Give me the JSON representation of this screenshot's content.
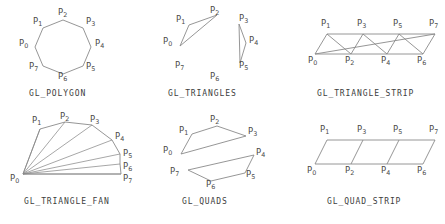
{
  "figure": {
    "background_color": "#ffffff",
    "line_color": "#8a8a8a",
    "label_color": "#4a4a4a",
    "caption_color": "#3d3d3d",
    "width": 445,
    "height": 224
  },
  "panels": [
    {
      "id": "gl-polygon",
      "caption": "GL_POLYGON",
      "vertex_count": 8,
      "vertices": [
        {
          "name": "P",
          "index": "0",
          "label_x": 9,
          "label_y": 39
        },
        {
          "name": "P",
          "index": "1",
          "label_x": 22,
          "label_y": 17
        },
        {
          "name": "P",
          "index": "2",
          "label_x": 48,
          "label_y": 8
        },
        {
          "name": "P",
          "index": "3",
          "label_x": 75,
          "label_y": 17
        },
        {
          "name": "P",
          "index": "4",
          "label_x": 86,
          "label_y": 39
        },
        {
          "name": "P",
          "index": "5",
          "label_x": 75,
          "label_y": 62
        },
        {
          "name": "P",
          "index": "6",
          "label_x": 48,
          "label_y": 72
        },
        {
          "name": "P",
          "index": "7",
          "label_x": 20,
          "label_y": 62
        }
      ],
      "caption_x": 22,
      "caption_y": 86
    },
    {
      "id": "gl-triangles",
      "caption": "GL_TRIANGLES",
      "vertex_count": 8,
      "vertices": [
        {
          "name": "P",
          "index": "0",
          "label_x": 2,
          "label_y": 36
        },
        {
          "name": "P",
          "index": "1",
          "label_x": 14,
          "label_y": 15
        },
        {
          "name": "P",
          "index": "2",
          "label_x": 45,
          "label_y": 5
        },
        {
          "name": "P",
          "index": "3",
          "label_x": 78,
          "label_y": 14
        },
        {
          "name": "P",
          "index": "4",
          "label_x": 88,
          "label_y": 35
        },
        {
          "name": "P",
          "index": "5",
          "label_x": 78,
          "label_y": 59
        },
        {
          "name": "P",
          "index": "6",
          "label_x": 48,
          "label_y": 72
        },
        {
          "name": "P",
          "index": "7",
          "label_x": 14,
          "label_y": 59
        }
      ],
      "caption_x": 10,
      "caption_y": 86
    },
    {
      "id": "gl-triangle-strip",
      "caption": "GL_TRIANGLE_STRIP",
      "vertex_count": 8,
      "vertices": [
        {
          "name": "P",
          "index": "0",
          "label_x": 2,
          "label_y": 56
        },
        {
          "name": "P",
          "index": "1",
          "label_x": 15,
          "label_y": 8
        },
        {
          "name": "P",
          "index": "2",
          "label_x": 42,
          "label_y": 56
        },
        {
          "name": "P",
          "index": "3",
          "label_x": 54,
          "label_y": 8
        },
        {
          "name": "P",
          "index": "4",
          "label_x": 80,
          "label_y": 56
        },
        {
          "name": "P",
          "index": "5",
          "label_x": 92,
          "label_y": 8
        },
        {
          "name": "P",
          "index": "6",
          "label_x": 116,
          "label_y": 56
        },
        {
          "name": "P",
          "index": "7",
          "label_x": 126,
          "label_y": 8
        }
      ],
      "caption_x": 16,
      "caption_y": 86
    },
    {
      "id": "gl-triangle-fan",
      "caption": "GL_TRIANGLE_FAN",
      "vertex_count": 8,
      "vertices": [
        {
          "name": "P",
          "index": "0",
          "label_x": 0,
          "label_y": 69
        },
        {
          "name": "P",
          "index": "1",
          "label_x": 21,
          "label_y": 7
        },
        {
          "name": "P",
          "index": "2",
          "label_x": 50,
          "label_y": 2
        },
        {
          "name": "P",
          "index": "3",
          "label_x": 79,
          "label_y": 6
        },
        {
          "name": "P",
          "index": "4",
          "label_x": 105,
          "label_y": 23
        },
        {
          "name": "P",
          "index": "5",
          "label_x": 114,
          "label_y": 41
        },
        {
          "name": "P",
          "index": "6",
          "label_x": 114,
          "label_y": 55
        },
        {
          "name": "P",
          "index": "7",
          "label_x": 114,
          "label_y": 69
        }
      ],
      "caption_x": 18,
      "caption_y": 86
    },
    {
      "id": "gl-quads",
      "caption": "GL_QUADS",
      "vertex_count": 8,
      "vertices": [
        {
          "name": "P",
          "index": "0",
          "label_x": 2,
          "label_y": 36
        },
        {
          "name": "P",
          "index": "1",
          "label_x": 18,
          "label_y": 17
        },
        {
          "name": "P",
          "index": "2",
          "label_x": 48,
          "label_y": 5
        },
        {
          "name": "P",
          "index": "3",
          "label_x": 82,
          "label_y": 17
        },
        {
          "name": "P",
          "index": "4",
          "label_x": 92,
          "label_y": 41
        },
        {
          "name": "P",
          "index": "5",
          "label_x": 81,
          "label_y": 60
        },
        {
          "name": "P",
          "index": "6",
          "label_x": 44,
          "label_y": 72
        },
        {
          "name": "P",
          "index": "7",
          "label_x": 10,
          "label_y": 60
        }
      ],
      "caption_x": 24,
      "caption_y": 86
    },
    {
      "id": "gl-quad-strip",
      "caption": "GL_QUAD_STRIP",
      "vertex_count": 8,
      "vertices": [
        {
          "name": "P",
          "index": "0",
          "label_x": 1,
          "label_y": 56
        },
        {
          "name": "P",
          "index": "1",
          "label_x": 14,
          "label_y": 8
        },
        {
          "name": "P",
          "index": "2",
          "label_x": 42,
          "label_y": 56
        },
        {
          "name": "P",
          "index": "3",
          "label_x": 54,
          "label_y": 8
        },
        {
          "name": "P",
          "index": "4",
          "label_x": 80,
          "label_y": 56
        },
        {
          "name": "P",
          "index": "5",
          "label_x": 92,
          "label_y": 8
        },
        {
          "name": "P",
          "index": "6",
          "label_x": 117,
          "label_y": 56
        },
        {
          "name": "P",
          "index": "7",
          "label_x": 127,
          "label_y": 8
        }
      ],
      "caption_x": 26,
      "caption_y": 86
    }
  ]
}
